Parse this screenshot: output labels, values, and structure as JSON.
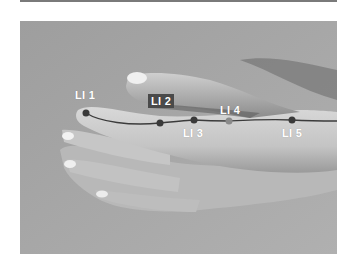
{
  "figure": {
    "meridian_line_color": "#3c3c3c",
    "point_color": "#3a3a3a",
    "highlight_point_color": "#8a8a8a",
    "label_box_color": "#4a4a4a",
    "points": [
      {
        "id": "li1",
        "label": "LI 1",
        "x": 86,
        "y": 113
      },
      {
        "id": "li2",
        "label": "LI 2",
        "x": 160,
        "y": 123,
        "boxed": true
      },
      {
        "id": "li3",
        "label": "LI 3",
        "x": 194,
        "y": 120
      },
      {
        "id": "li4",
        "label": "LI 4",
        "x": 229,
        "y": 121,
        "highlight": true
      },
      {
        "id": "li5",
        "label": "LI 5",
        "x": 292,
        "y": 120
      }
    ]
  }
}
